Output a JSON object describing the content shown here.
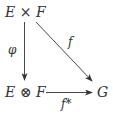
{
  "diagram": {
    "type": "commutative-diagram",
    "nodes": {
      "top_left": {
        "left": "E",
        "op": "×",
        "right": "F"
      },
      "bottom_left": {
        "left": "E",
        "op": "⊗",
        "right": "F"
      },
      "bottom_right": {
        "label": "G"
      }
    },
    "arrows": {
      "vertical": {
        "label": "φ",
        "from": "E × F",
        "to": "E ⊗ F"
      },
      "diagonal": {
        "label": "f",
        "from": "E × F",
        "to": "G"
      },
      "horizontal": {
        "label": "f*",
        "from": "E ⊗ F",
        "to": "G"
      }
    },
    "colors": {
      "ink": "#333333",
      "background": "#ffffff"
    }
  }
}
